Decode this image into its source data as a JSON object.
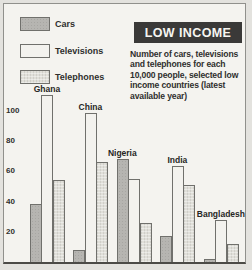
{
  "panel": {
    "title": "LOW INCOME",
    "description_lines": [
      "Number of cars, televisions",
      "and telephones for each",
      "10,000 people, selected low",
      "income countries (latest",
      "available year)"
    ]
  },
  "legend": {
    "items": [
      {
        "label": "Cars",
        "swatch": "cars-swatch"
      },
      {
        "label": "Televisions",
        "swatch": "televisions-swatch"
      },
      {
        "label": "Telephones",
        "swatch": "telephones-swatch"
      }
    ]
  },
  "chart_data": {
    "type": "bar",
    "title": "LOW INCOME",
    "subtitle": "Number of cars, televisions and telephones for each 10,000 people, selected low income countries (latest available year)",
    "categories": [
      "Ghana",
      "China",
      "Nigeria",
      "India",
      "Bangladesh"
    ],
    "series": [
      {
        "name": "Cars",
        "values": [
          38,
          8,
          68,
          17,
          2
        ]
      },
      {
        "name": "Televisions",
        "values": [
          110,
          98,
          55,
          63,
          28
        ]
      },
      {
        "name": "Telephones",
        "values": [
          54,
          66,
          26,
          51,
          12
        ]
      }
    ],
    "xlabel": "",
    "ylabel": "",
    "yticks": [
      20,
      40,
      60,
      80,
      100
    ],
    "ylim": [
      0,
      115
    ],
    "grid": false,
    "legend_position": "top-left"
  },
  "colors": {
    "outer_bg": "#e3e2de",
    "card_bg": "#f4f3ef",
    "frame_border": "#90908c",
    "axis_line": "#4c4b47",
    "title_bg": "#3a3938",
    "title_text": "#f6f5f1",
    "text": "#2f2f2d",
    "bar_cars": "#b6b5b1",
    "bar_televisions": "#f3f2ee",
    "bar_telephones": "#e0dfd9",
    "bar_border": "#70706c"
  }
}
